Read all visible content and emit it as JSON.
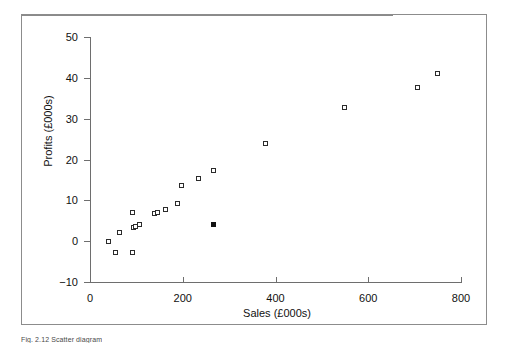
{
  "figure": {
    "caption": "Fig. 2.12  Scatter diagram"
  },
  "chart_data": {
    "type": "scatter",
    "title": "",
    "xlabel": "Sales (£000s)",
    "ylabel": "Profits (£000s)",
    "xlim": [
      0,
      800
    ],
    "ylim": [
      -10,
      50
    ],
    "xticks": [
      0,
      200,
      400,
      600,
      800
    ],
    "yticks": [
      -10,
      0,
      10,
      20,
      30,
      40,
      50
    ],
    "xtick_labels": [
      "0",
      "200",
      "400",
      "600",
      "800"
    ],
    "ytick_labels": [
      "−10",
      "0",
      "10",
      "20",
      "30",
      "40",
      "50"
    ],
    "grid": false,
    "legend": false,
    "zero_reference_line": 0,
    "marker": "square",
    "series": [
      {
        "name": "Companies",
        "marker_style": "open-square",
        "color": "#2b2b2b",
        "points": [
          {
            "x": 40,
            "y": -0.3
          },
          {
            "x": 55,
            "y": -2.8
          },
          {
            "x": 65,
            "y": 2.0
          },
          {
            "x": 92,
            "y": 7.0
          },
          {
            "x": 93,
            "y": -2.8
          },
          {
            "x": 95,
            "y": 3.2
          },
          {
            "x": 100,
            "y": 3.5
          },
          {
            "x": 108,
            "y": 4.0
          },
          {
            "x": 140,
            "y": 6.6
          },
          {
            "x": 147,
            "y": 6.8
          },
          {
            "x": 163,
            "y": 7.6
          },
          {
            "x": 190,
            "y": 9.0
          },
          {
            "x": 198,
            "y": 13.5
          },
          {
            "x": 235,
            "y": 15.3
          },
          {
            "x": 268,
            "y": 17.2
          },
          {
            "x": 380,
            "y": 23.8
          },
          {
            "x": 550,
            "y": 32.7
          },
          {
            "x": 707,
            "y": 37.5
          },
          {
            "x": 750,
            "y": 41.0
          }
        ]
      },
      {
        "name": "Highlighted company",
        "marker_style": "filled-square",
        "color": "#111111",
        "points": [
          {
            "x": 268,
            "y": 4.0
          }
        ]
      }
    ]
  }
}
